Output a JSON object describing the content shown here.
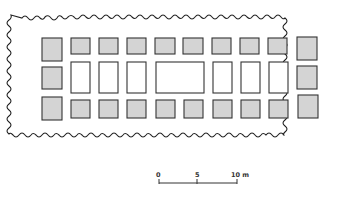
{
  "diagram": {
    "type": "architectural-plan",
    "colors": {
      "shaded_fill": "#d4d4d4",
      "stroke": "#333333",
      "background": "#ffffff"
    },
    "rows": {
      "top": {
        "shaded_count": 10
      },
      "middle": {
        "shaded_count": 2,
        "open_count": 7,
        "center_large": true
      },
      "bottom": {
        "shaded_count": 10
      }
    }
  },
  "scale_bar": {
    "labels": [
      "0",
      "5",
      "10 m"
    ],
    "unit": "m"
  }
}
